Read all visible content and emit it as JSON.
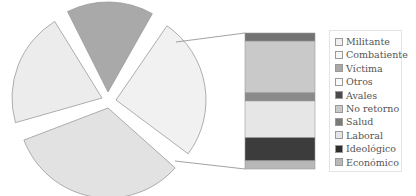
{
  "chart_data": {
    "type": "pie",
    "subtype": "bar-of-pie",
    "title": "",
    "pie": {
      "slices": [
        {
          "name": "Exploded (breakdown)",
          "value": 27,
          "color": "#f1f1f1"
        },
        {
          "name": "Bottom",
          "value": 34,
          "color": "#e2e2e2"
        },
        {
          "name": "Left",
          "value": 22,
          "color": "#ececec"
        },
        {
          "name": "Víctima",
          "value": 17,
          "color": "#a9a9a9"
        }
      ]
    },
    "bar": {
      "segments": [
        {
          "name": "Avales",
          "value": 6,
          "color": "#737373"
        },
        {
          "name": "No retorno",
          "value": 38,
          "color": "#c9c9c9"
        },
        {
          "name": "Salud",
          "value": 6,
          "color": "#8a8a8a"
        },
        {
          "name": "Laboral",
          "value": 27,
          "color": "#e6e6e6"
        },
        {
          "name": "Ideológico",
          "value": 17,
          "color": "#3c3c3c"
        },
        {
          "name": "Económico",
          "value": 6,
          "color": "#b8b8b8"
        }
      ]
    },
    "legend": {
      "position": "right",
      "entries": [
        {
          "label": "Militante",
          "color": "#f0f0f0"
        },
        {
          "label": "Combatiente",
          "color": "#f7f7f7"
        },
        {
          "label": "Víctima",
          "color": "#a9a9a9"
        },
        {
          "label": "Otros",
          "color": "#fbfbfb"
        },
        {
          "label": "Avales",
          "color": "#4a4a4a"
        },
        {
          "label": "No retorno",
          "color": "#c9c9c9"
        },
        {
          "label": "Salud",
          "color": "#7a7a7a"
        },
        {
          "label": "Laboral",
          "color": "#e6e6e6"
        },
        {
          "label": "Ideológico",
          "color": "#2e2e2e"
        },
        {
          "label": "Económico",
          "color": "#b8b8b8"
        }
      ]
    },
    "grid": false
  }
}
